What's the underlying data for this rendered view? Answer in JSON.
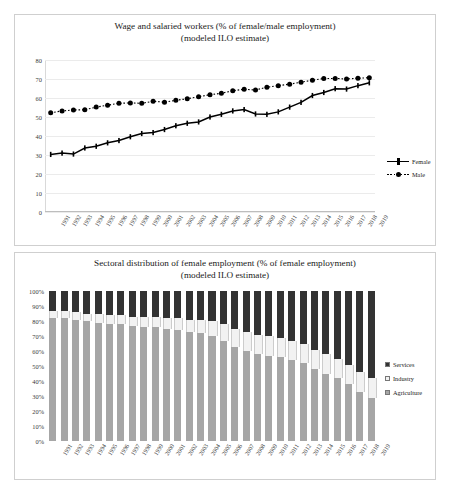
{
  "chart_data": [
    {
      "type": "line",
      "panel": "top",
      "title_line1": "Wage and salaried workers (% of female/male employment)",
      "title_line2": "(modeled ILO estimate)",
      "xlabel": "",
      "ylabel": "",
      "ylim": [
        0,
        80
      ],
      "yticks": [
        "0",
        "10",
        "20",
        "30",
        "40",
        "50",
        "60",
        "70",
        "80"
      ],
      "grid": true,
      "legend_position": "right",
      "x": [
        "1991",
        "1992",
        "1993",
        "1994",
        "1995",
        "1996",
        "1997",
        "1998",
        "1999",
        "2000",
        "2001",
        "2002",
        "2003",
        "2004",
        "2005",
        "2006",
        "2007",
        "2008",
        "2009",
        "2010",
        "2011",
        "2012",
        "2013",
        "2014",
        "2015",
        "2016",
        "2017",
        "2018",
        "2019"
      ],
      "series": [
        {
          "name": "Female",
          "style": "solid-line-with-cross-markers",
          "values": [
            30.3,
            31.0,
            30.5,
            33.7,
            34.6,
            36.4,
            37.6,
            39.6,
            41.3,
            41.8,
            43.4,
            45.4,
            46.7,
            47.4,
            50.0,
            51.4,
            53.2,
            53.9,
            51.6,
            51.4,
            52.7,
            55.2,
            57.7,
            61.3,
            62.9,
            64.9,
            64.7,
            66.5,
            68.0
          ]
        },
        {
          "name": "Male",
          "style": "dotted-line-with-circle-markers",
          "values": [
            52.2,
            53.2,
            53.7,
            53.8,
            55.2,
            56.2,
            57.2,
            57.4,
            57.2,
            58.3,
            57.8,
            58.8,
            59.6,
            60.7,
            61.7,
            62.5,
            63.8,
            64.6,
            64.2,
            65.7,
            66.5,
            67.3,
            68.3,
            69.4,
            70.3,
            70.3,
            70.0,
            70.4,
            70.7
          ]
        }
      ]
    },
    {
      "type": "bar",
      "subtype": "stacked-100-percent",
      "panel": "bottom",
      "title_line1": "Sectoral distribution of female employment (% of female employment)",
      "title_line2": "(modeled ILO estimate)",
      "xlabel": "",
      "ylabel": "",
      "ylim": [
        0,
        100
      ],
      "yticks": [
        "0%",
        "10%",
        "20%",
        "30%",
        "40%",
        "50%",
        "60%",
        "70%",
        "80%",
        "90%",
        "100%"
      ],
      "grid": false,
      "legend_position": "right",
      "categories": [
        "1991",
        "1992",
        "1993",
        "1994",
        "1995",
        "1996",
        "1997",
        "1998",
        "1999",
        "2000",
        "2001",
        "2002",
        "2003",
        "2004",
        "2005",
        "2006",
        "2007",
        "2008",
        "2009",
        "2010",
        "2011",
        "2012",
        "2013",
        "2014",
        "2015",
        "2016",
        "2017",
        "2018",
        "2019"
      ],
      "series": [
        {
          "name": "Agriculture",
          "color": "#a6a6a6",
          "values": [
            82,
            82,
            81,
            80,
            79,
            78,
            78,
            77,
            76,
            76,
            75,
            74,
            73,
            72,
            70,
            67,
            63,
            60,
            58,
            57,
            56,
            54,
            52,
            48,
            45,
            42,
            38,
            33,
            29
          ]
        },
        {
          "name": "Industry",
          "color": "#f2f2f2",
          "values": [
            5,
            5,
            5,
            5,
            6,
            6,
            6,
            6,
            7,
            7,
            7,
            8,
            8,
            9,
            10,
            11,
            12,
            13,
            13,
            13,
            13,
            13,
            13,
            13,
            13,
            13,
            13,
            13,
            13
          ]
        },
        {
          "name": "Services",
          "color": "#333333",
          "values": [
            13,
            13,
            14,
            15,
            15,
            16,
            16,
            17,
            17,
            17,
            18,
            18,
            19,
            19,
            20,
            22,
            25,
            27,
            29,
            30,
            31,
            33,
            35,
            39,
            42,
            45,
            49,
            54,
            58
          ]
        }
      ],
      "legend_order": [
        "Services",
        "Industry",
        "Agriculture"
      ]
    }
  ]
}
